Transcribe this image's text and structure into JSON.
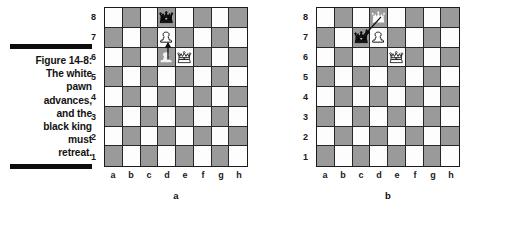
{
  "caption": {
    "label": "Figure 14-8:",
    "body": "The white pawn advances, and the black king must retreat.",
    "line1": "Figure 14-8:",
    "line2": "The white",
    "line3": "pawn",
    "line4": "advances,",
    "line5": "and the",
    "line6": "black king",
    "line7": "must",
    "line8": "retreat."
  },
  "colors": {
    "light_square": "#fdfdfd",
    "dark_square": "#9a9a9a",
    "border": "#1b1b1b",
    "rule": "#0d0d0d",
    "text": "#1a1a1a"
  },
  "files": [
    "a",
    "b",
    "c",
    "d",
    "e",
    "f",
    "g",
    "h"
  ],
  "ranks": [
    "8",
    "7",
    "6",
    "5",
    "4",
    "3",
    "2",
    "1"
  ],
  "boards": [
    {
      "tag": "a",
      "name": "diagram-a",
      "pieces": [
        {
          "square": "d8",
          "piece": "black-king",
          "kind": "king",
          "side": "black",
          "style": "solid"
        },
        {
          "square": "d7",
          "piece": "white-pawn",
          "kind": "pawn",
          "side": "white",
          "style": "solid"
        },
        {
          "square": "d6",
          "piece": "white-pawn",
          "kind": "pawn",
          "side": "white",
          "style": "ghost"
        },
        {
          "square": "e6",
          "piece": "white-king",
          "kind": "king",
          "side": "white",
          "style": "solid"
        }
      ],
      "arrows": [
        {
          "from": "d6",
          "to": "d7",
          "name": "move-arrow-pawn-d6-d7"
        }
      ]
    },
    {
      "tag": "b",
      "name": "diagram-b",
      "pieces": [
        {
          "square": "d8",
          "piece": "black-king",
          "kind": "king",
          "side": "black",
          "style": "blob"
        },
        {
          "square": "c7",
          "piece": "black-king",
          "kind": "king",
          "side": "black",
          "style": "solid"
        },
        {
          "square": "d7",
          "piece": "white-pawn",
          "kind": "pawn",
          "side": "white",
          "style": "solid"
        },
        {
          "square": "e6",
          "piece": "white-king",
          "kind": "king",
          "side": "white",
          "style": "solid"
        }
      ],
      "arrows": [
        {
          "from": "d8",
          "to": "c7",
          "name": "move-arrow-king-d8-c7"
        }
      ]
    }
  ]
}
